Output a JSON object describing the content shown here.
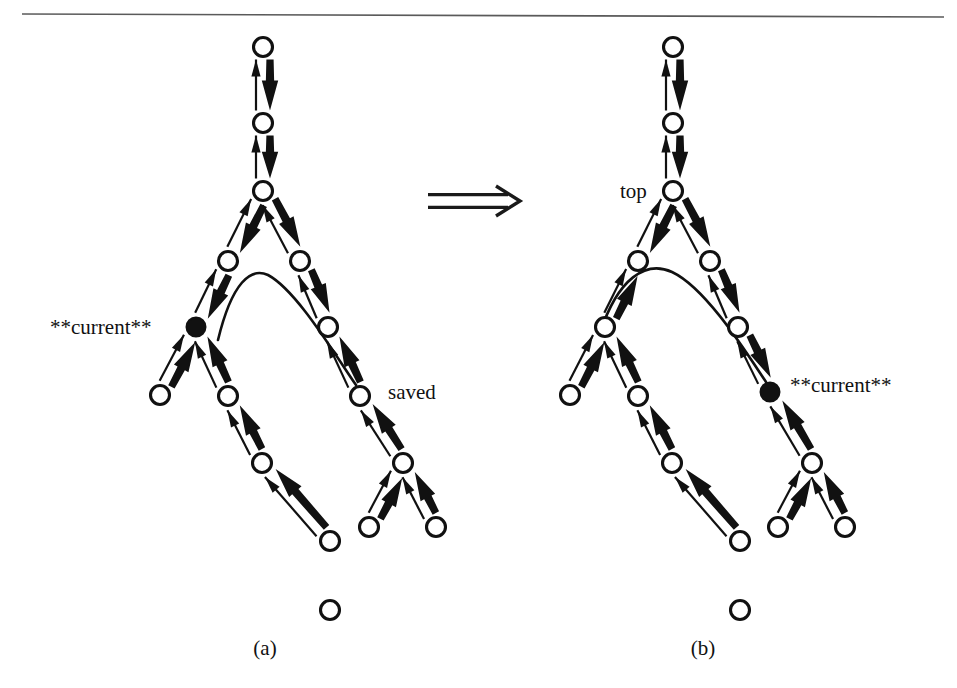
{
  "figure": {
    "background_color": "#ffffff",
    "ink_color": "#111111",
    "rule_color": "#5a5a5a",
    "transition_symbol": "double-right-arrow",
    "panels": [
      {
        "id": "a",
        "caption": "(a)",
        "caption_x": 265,
        "caption_y": 655,
        "labels": [
          {
            "name": "current-label",
            "text": "**current**",
            "x": 50,
            "y": 334,
            "anchor": "start"
          },
          {
            "name": "saved-label",
            "text": "saved",
            "x": 388,
            "y": 399,
            "anchor": "start"
          }
        ],
        "nodes": [
          {
            "id": "a-n1",
            "x": 263,
            "y": 47,
            "r": 9.5,
            "filled": false
          },
          {
            "id": "a-n2",
            "x": 263,
            "y": 123,
            "r": 9.5,
            "filled": false
          },
          {
            "id": "a-n3",
            "x": 263,
            "y": 191,
            "r": 9.5,
            "filled": false
          },
          {
            "id": "a-n4",
            "x": 228,
            "y": 261,
            "r": 9.5,
            "filled": false
          },
          {
            "id": "a-n5",
            "x": 300,
            "y": 261,
            "r": 9.5,
            "filled": false
          },
          {
            "id": "a-n6",
            "x": 196,
            "y": 327,
            "r": 9.5,
            "filled": true
          },
          {
            "id": "a-n7",
            "x": 328,
            "y": 327,
            "r": 9.5,
            "filled": false
          },
          {
            "id": "a-n8",
            "x": 160,
            "y": 395,
            "r": 9.5,
            "filled": false
          },
          {
            "id": "a-n9",
            "x": 228,
            "y": 396,
            "r": 9.5,
            "filled": false
          },
          {
            "id": "a-n10",
            "x": 360,
            "y": 396,
            "r": 9.5,
            "filled": false
          },
          {
            "id": "a-n11",
            "x": 262,
            "y": 463,
            "r": 9.5,
            "filled": false
          },
          {
            "id": "a-n12",
            "x": 403,
            "y": 463,
            "r": 9.5,
            "filled": false
          },
          {
            "id": "a-n13",
            "x": 330,
            "y": 541,
            "r": 9.5,
            "filled": false
          },
          {
            "id": "a-n14",
            "x": 369,
            "y": 527,
            "r": 9.5,
            "filled": false
          },
          {
            "id": "a-n15",
            "x": 436,
            "y": 527,
            "r": 9.5,
            "filled": false
          },
          {
            "id": "a-n16",
            "x": 330,
            "y": 610,
            "r": 9.5,
            "filled": false
          }
        ],
        "edges": [
          {
            "from": "a-n2",
            "to": "a-n1",
            "kind": "double"
          },
          {
            "from": "a-n3",
            "to": "a-n2",
            "kind": "double"
          },
          {
            "from": "a-n4",
            "to": "a-n3",
            "kind": "double"
          },
          {
            "from": "a-n5",
            "to": "a-n3",
            "kind": "double"
          },
          {
            "from": "a-n6",
            "to": "a-n4",
            "kind": "double"
          },
          {
            "from": "a-n7",
            "to": "a-n5",
            "kind": "double"
          },
          {
            "from": "a-n8",
            "to": "a-n6",
            "kind": "up"
          },
          {
            "from": "a-n9",
            "to": "a-n6",
            "kind": "up"
          },
          {
            "from": "a-n10",
            "to": "a-n7",
            "kind": "up"
          },
          {
            "from": "a-n11",
            "to": "a-n9",
            "kind": "up"
          },
          {
            "from": "a-n12",
            "to": "a-n10",
            "kind": "up"
          },
          {
            "from": "a-n13",
            "to": "a-n11",
            "kind": "up"
          },
          {
            "from": "a-n14",
            "to": "a-n12",
            "kind": "up"
          },
          {
            "from": "a-n15",
            "to": "a-n12",
            "kind": "up"
          }
        ],
        "curve": {
          "name": "saved-pointer-curve",
          "from_node": "a-n6",
          "to_node": "a-n10",
          "path": "M 218 340 C 232 282 251 267 268 275 C 296 290 332 350 356 385"
        }
      },
      {
        "id": "b",
        "caption": "(b)",
        "caption_x": 703,
        "caption_y": 655,
        "labels": [
          {
            "name": "top-label",
            "text": "top",
            "x": 620,
            "y": 198,
            "anchor": "start"
          },
          {
            "name": "current-label",
            "text": "**current**",
            "x": 790,
            "y": 392,
            "anchor": "start"
          }
        ],
        "nodes": [
          {
            "id": "b-n1",
            "x": 673,
            "y": 47,
            "r": 9.5,
            "filled": false
          },
          {
            "id": "b-n2",
            "x": 673,
            "y": 123,
            "r": 9.5,
            "filled": false
          },
          {
            "id": "b-n3",
            "x": 673,
            "y": 191,
            "r": 9.5,
            "filled": false
          },
          {
            "id": "b-n4",
            "x": 638,
            "y": 261,
            "r": 9.5,
            "filled": false
          },
          {
            "id": "b-n5",
            "x": 710,
            "y": 261,
            "r": 9.5,
            "filled": false
          },
          {
            "id": "b-n6",
            "x": 605,
            "y": 327,
            "r": 9.5,
            "filled": false
          },
          {
            "id": "b-n7",
            "x": 738,
            "y": 327,
            "r": 9.5,
            "filled": false
          },
          {
            "id": "b-n8",
            "x": 570,
            "y": 395,
            "r": 9.5,
            "filled": false
          },
          {
            "id": "b-n9",
            "x": 638,
            "y": 396,
            "r": 9.5,
            "filled": false
          },
          {
            "id": "b-n10",
            "x": 770,
            "y": 392,
            "r": 9.5,
            "filled": true
          },
          {
            "id": "b-n11",
            "x": 672,
            "y": 463,
            "r": 9.5,
            "filled": false
          },
          {
            "id": "b-n12",
            "x": 812,
            "y": 463,
            "r": 9.5,
            "filled": false
          },
          {
            "id": "b-n13",
            "x": 740,
            "y": 541,
            "r": 9.5,
            "filled": false
          },
          {
            "id": "b-n14",
            "x": 778,
            "y": 527,
            "r": 9.5,
            "filled": false
          },
          {
            "id": "b-n15",
            "x": 845,
            "y": 527,
            "r": 9.5,
            "filled": false
          },
          {
            "id": "b-n16",
            "x": 740,
            "y": 610,
            "r": 9.5,
            "filled": false
          }
        ],
        "edges": [
          {
            "from": "b-n2",
            "to": "b-n1",
            "kind": "double"
          },
          {
            "from": "b-n3",
            "to": "b-n2",
            "kind": "double"
          },
          {
            "from": "b-n4",
            "to": "b-n3",
            "kind": "double"
          },
          {
            "from": "b-n5",
            "to": "b-n3",
            "kind": "double"
          },
          {
            "from": "b-n6",
            "to": "b-n4",
            "kind": "up"
          },
          {
            "from": "b-n7",
            "to": "b-n5",
            "kind": "double"
          },
          {
            "from": "b-n8",
            "to": "b-n6",
            "kind": "up"
          },
          {
            "from": "b-n9",
            "to": "b-n6",
            "kind": "up"
          },
          {
            "from": "b-n10",
            "to": "b-n7",
            "kind": "double"
          },
          {
            "from": "b-n11",
            "to": "b-n9",
            "kind": "up"
          },
          {
            "from": "b-n12",
            "to": "b-n10",
            "kind": "up"
          },
          {
            "from": "b-n13",
            "to": "b-n11",
            "kind": "up"
          },
          {
            "from": "b-n14",
            "to": "b-n12",
            "kind": "up"
          },
          {
            "from": "b-n15",
            "to": "b-n12",
            "kind": "up"
          }
        ],
        "curve": {
          "name": "top-pointer-curve",
          "from_node": "b-n6",
          "to_node": "b-n10",
          "path": "M 600 333 C 618 278 646 260 672 272 C 706 288 746 352 766 382"
        }
      }
    ],
    "rule": {
      "x1": 22,
      "y1": 14,
      "x2": 944,
      "y2": 17
    },
    "implies": {
      "x": 428,
      "y": 185,
      "width": 92,
      "height": 32
    }
  }
}
